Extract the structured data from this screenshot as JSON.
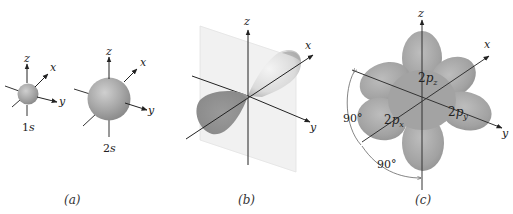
{
  "panels": [
    {
      "id": "a",
      "caption": "(a)",
      "orbitals": [
        {
          "name": "1s",
          "label_num": "1",
          "label_letter": "s"
        },
        {
          "name": "2s",
          "label_num": "2",
          "label_letter": "s"
        }
      ],
      "axes": {
        "x": "x",
        "y": "y",
        "z": "z"
      }
    },
    {
      "id": "b",
      "caption": "(b)",
      "axes": {
        "x": "x",
        "y": "y",
        "z": "z"
      }
    },
    {
      "id": "c",
      "caption": "(c)",
      "axes": {
        "x": "x",
        "y": "y",
        "z": "z"
      },
      "orbital_labels": {
        "pz": {
          "num": "2",
          "letter": "p",
          "sub": "z"
        },
        "px": {
          "num": "2",
          "letter": "p",
          "sub": "x"
        },
        "py": {
          "num": "2",
          "letter": "p",
          "sub": "y"
        }
      },
      "angles": [
        "90°",
        "90°"
      ]
    }
  ],
  "colors": {
    "orbital_fill": "#a9a9a9",
    "orbital_dark": "#8a8a8a",
    "plane": "#f0f0f0",
    "axis": "#222222"
  }
}
